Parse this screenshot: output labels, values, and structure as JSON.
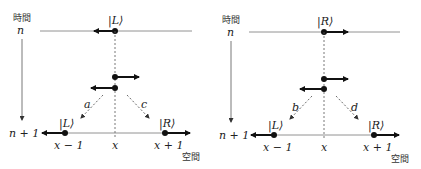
{
  "panels": [
    {
      "id": "left",
      "time_axis_label": "時間",
      "space_axis_label": "空間",
      "time_n": "n",
      "time_n1": "n + 1",
      "top_state": "|L⟩",
      "bottom_left_state": "|L⟩",
      "bottom_right_state": "|R⟩",
      "x_minus": "x − 1",
      "x_center": "x",
      "x_plus": "x + 1",
      "coef_left": "a",
      "coef_right": "c"
    },
    {
      "id": "right",
      "time_axis_label": "時間",
      "space_axis_label": "空間",
      "time_n": "n",
      "time_n1": "n + 1",
      "top_state": "|R⟩",
      "bottom_left_state": "|L⟩",
      "bottom_right_state": "|R⟩",
      "x_minus": "x − 1",
      "x_center": "x",
      "x_plus": "x + 1",
      "coef_left": "b",
      "coef_right": "d"
    }
  ]
}
